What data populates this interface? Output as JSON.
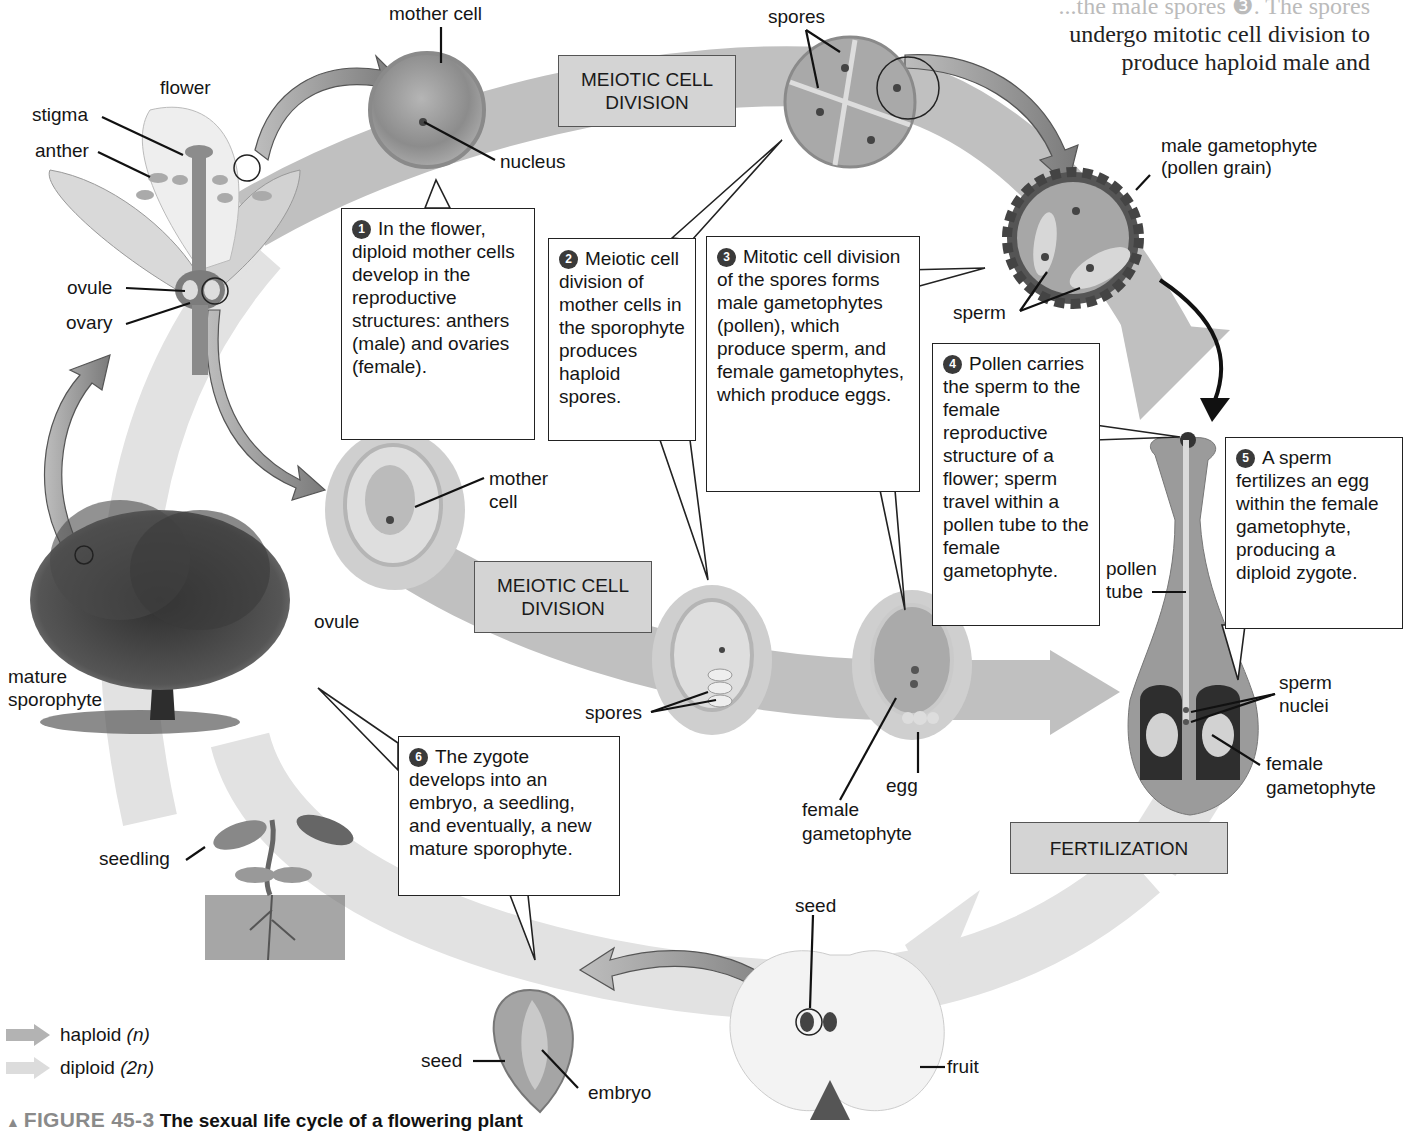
{
  "book_text": {
    "line0": "...the male spores ❸. The spores",
    "line1": "undergo mitotic cell division to",
    "line2": "produce haploid male and"
  },
  "stages": {
    "meiotic_top": "MEIOTIC CELL DIVISION",
    "meiotic_middle": "MEIOTIC CELL DIVISION",
    "fertilization": "FERTILIZATION"
  },
  "labels": {
    "flower": "flower",
    "stigma": "stigma",
    "anther": "anther",
    "ovule_flower": "ovule",
    "ovary": "ovary",
    "mother_cell_top": "mother cell",
    "nucleus": "nucleus",
    "spores_top": "spores",
    "male_gametophyte_1": "male gametophyte",
    "male_gametophyte_2": "(pollen grain)",
    "sperm": "sperm",
    "mother_cell_ovule_1": "mother",
    "mother_cell_ovule_2": "cell",
    "ovule_mid": "ovule",
    "spores_bottom": "spores",
    "egg": "egg",
    "female_gametophyte_mid_1": "female",
    "female_gametophyte_mid_2": "gametophyte",
    "pollen_tube_1": "pollen",
    "pollen_tube_2": "tube",
    "sperm_nuclei_1": "sperm",
    "sperm_nuclei_2": "nuclei",
    "female_gametophyte_right_1": "female",
    "female_gametophyte_right_2": "gametophyte",
    "mature_sporophyte_1": "mature",
    "mature_sporophyte_2": "sporophyte",
    "seedling": "seedling",
    "seed_fruit": "seed",
    "fruit": "fruit",
    "seed_embryo": "seed",
    "embryo": "embryo"
  },
  "callouts": [
    {
      "step": "1",
      "text": "In the flower, diploid mother cells develop in the reproductive structures: anthers (male) and ovaries (female)."
    },
    {
      "step": "2",
      "text": "Meiotic cell division of mother cells in the sporophyte produces haploid spores."
    },
    {
      "step": "3",
      "text": "Mitotic cell division of the spores forms male gametophytes (pollen), which produce sperm, and female gametophytes, which produce eggs."
    },
    {
      "step": "4",
      "text": "Pollen carries the sperm to the female reproductive structure of a flower; sperm travel within a pollen tube to the female gametophyte."
    },
    {
      "step": "5",
      "text": "A sperm fertilizes an egg within the female gametophyte, producing a diploid zygote."
    },
    {
      "step": "6",
      "text": "The zygote develops into an embryo, a seedling, and eventually, a new mature sporophyte."
    }
  ],
  "legend": [
    {
      "label": "haploid",
      "symbol": "(n)",
      "color": "#b3b3b3"
    },
    {
      "label": "diploid",
      "symbol": "(2n)",
      "color": "#dcdcdc"
    }
  ],
  "caption": {
    "marker": "▲",
    "figure": "FIGURE 45-3",
    "title": "The sexual life cycle of a flowering plant"
  },
  "colors": {
    "haploid_band": "#b9b9b9",
    "diploid_band": "#e2e2e2",
    "stage_box": "#d4d4d4",
    "organism_arrow": "#8f8f8f"
  }
}
